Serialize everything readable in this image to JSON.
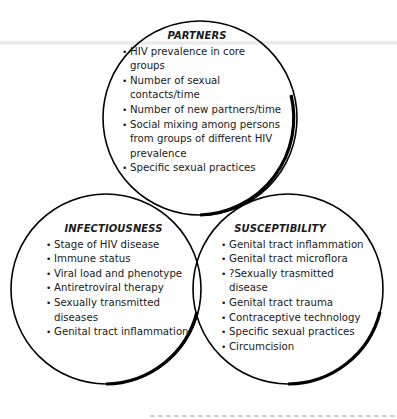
{
  "diagram": {
    "type": "venn-3-circle",
    "circles": [
      {
        "id": "partners",
        "title": "PARTNERS",
        "items": [
          "HIV prevalence in core groups",
          "Number of sexual contacts/time",
          "Number of new partners/time",
          "Social mixing among persons from groups of different HIV prevalence",
          "Specific sexual practices"
        ]
      },
      {
        "id": "infectiousness",
        "title": "INFECTIOUSNESS",
        "items": [
          "Stage of HIV disease",
          "Immune status",
          "Viral load and phenotype",
          "Antiretroviral therapy",
          "Sexually transmitted diseases",
          "Genital tract inflammation"
        ]
      },
      {
        "id": "susceptibility",
        "title": "SUSCEPTIBILITY",
        "items": [
          "Genital tract inflammation",
          "Genital tract microflora",
          "?Sexually trasmitted disease",
          "Genital tract trauma",
          "Contraceptive technology",
          "Specific sexual practices",
          "Circumcision"
        ]
      }
    ],
    "colors": {
      "outline": "#000000",
      "background": "#ffffff",
      "text": "#1a1a1a"
    }
  }
}
